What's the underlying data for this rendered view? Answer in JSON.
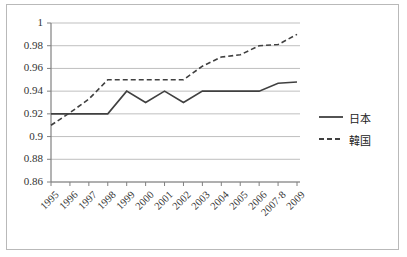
{
  "chart_data": {
    "type": "line",
    "title": "",
    "xlabel": "",
    "ylabel": "",
    "categories": [
      "1995",
      "1996",
      "1997",
      "1998",
      "1999",
      "2000",
      "2001",
      "2002",
      "2003",
      "2004",
      "2005",
      "2006",
      "2007·8",
      "2009"
    ],
    "ylim": [
      0.86,
      1.0
    ],
    "ytick_step": 0.02,
    "yticks": [
      "1",
      "0.98",
      "0.96",
      "0.94",
      "0.92",
      "0.9",
      "0.88",
      "0.86"
    ],
    "ytick_values": [
      1,
      0.98,
      0.96,
      0.94,
      0.92,
      0.9,
      0.88,
      0.86
    ],
    "grid": true,
    "legend_position": "right",
    "series": [
      {
        "name": "日本",
        "style": "solid",
        "color": "#404040",
        "values": [
          0.92,
          0.92,
          0.92,
          0.92,
          0.94,
          0.93,
          0.94,
          0.93,
          0.94,
          0.94,
          0.94,
          0.94,
          0.947,
          0.948
        ]
      },
      {
        "name": "韓国",
        "style": "dashed",
        "color": "#404040",
        "values": [
          0.91,
          0.921,
          0.933,
          0.95,
          0.95,
          0.95,
          0.95,
          0.95,
          0.962,
          0.97,
          0.972,
          0.98,
          0.981,
          0.99
        ]
      }
    ]
  },
  "legend": {
    "items": [
      {
        "label": "日本",
        "style": "solid"
      },
      {
        "label": "韓国",
        "style": "dashed"
      }
    ]
  },
  "colors": {
    "line": "#404040",
    "grid": "#bfbfbf",
    "axis": "#808080",
    "border": "#b9b9b9",
    "text": "#333333"
  }
}
